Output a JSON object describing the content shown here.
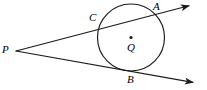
{
  "figure": {
    "background_color": "#ffffff",
    "stroke_color": "#1a1a1a",
    "width": 207,
    "height": 90,
    "labels": {
      "p": "P",
      "c": "C",
      "a": "A",
      "q": "Q",
      "b": "B"
    },
    "circle": {
      "center_x": 131,
      "center_y": 37.5,
      "radius": 33.5,
      "center_dot_radius": 1.6
    },
    "external_point": {
      "x": 16,
      "y": 51
    },
    "secant_line": {
      "from_x": 16,
      "from_y": 51,
      "to_x": 192,
      "to_y": 5,
      "entry_label": "C",
      "exit_label": "A",
      "entry_x": 99,
      "entry_y": 29,
      "exit_x": 152,
      "exit_y": 15
    },
    "tangent_line": {
      "from_x": 16,
      "from_y": 51,
      "to_x": 196,
      "to_y": 83,
      "touch_label": "B",
      "touch_x": 130,
      "touch_y": 71
    },
    "arrowheads": [
      {
        "name": "secant-arrowhead",
        "tip_x": 192,
        "tip_y": 5
      },
      {
        "name": "tangent-arrowhead",
        "tip_x": 196,
        "tip_y": 83
      }
    ]
  }
}
